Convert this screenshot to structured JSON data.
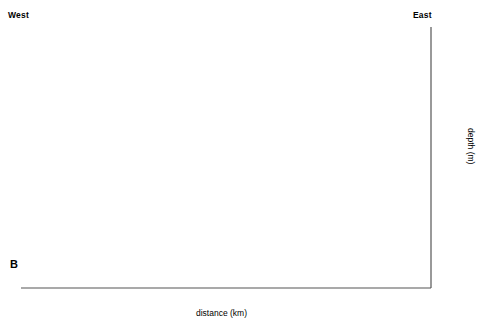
{
  "labels": {
    "west": "West",
    "east": "East",
    "panel": "B",
    "x_axis_title": "distance (km)",
    "y_axis_title": "depth (m)"
  },
  "axes": {
    "x_ticks": [
      "100",
      "110",
      "120",
      "130",
      "140",
      "150"
    ],
    "x_tick_values": [
      100,
      110,
      120,
      130,
      140,
      150
    ],
    "y_ticks": [
      "+3.0",
      "+2.0",
      "+1.0",
      "O.D.",
      "-1.0",
      "-2.0",
      "-3.0",
      "-4.0",
      "-5.0"
    ],
    "y_tick_values": [
      3,
      2,
      1,
      0,
      -1,
      -2,
      -3,
      -4,
      -5
    ]
  },
  "chart_data": {
    "type": "scatter",
    "title": "",
    "xlabel": "distance (km)",
    "ylabel": "depth (m)",
    "xlim": [
      100,
      150
    ],
    "ylim": [
      -5.0,
      3.0
    ],
    "grid": false,
    "legend": "none",
    "panel_label": "B",
    "direction_left": "West",
    "direction_right": "East",
    "y_tick_labels": [
      "+3.0",
      "+2.0",
      "+1.0",
      "O.D.",
      "-1.0",
      "-2.0",
      "-3.0",
      "-4.0",
      "-5.0"
    ],
    "x_tick_labels": [
      "100",
      "110",
      "120",
      "130",
      "140",
      "150"
    ],
    "points": [
      {
        "x": 107.0,
        "y": -3.6
      },
      {
        "x": 110.0,
        "y": -3.6
      },
      {
        "x": 110.0,
        "y": -3.28
      },
      {
        "x": 115.5,
        "y": -1.57
      },
      {
        "x": 117.0,
        "y": -1.42
      },
      {
        "x": 120.8,
        "y": -0.63
      },
      {
        "x": 125.0,
        "y": -0.99
      },
      {
        "x": 126.3,
        "y": -0.95
      },
      {
        "x": 126.3,
        "y": -1.28
      },
      {
        "x": 131.3,
        "y": 0.35
      },
      {
        "x": 131.3,
        "y": 0.05
      },
      {
        "x": 134.0,
        "y": 0.39
      },
      {
        "x": 137.7,
        "y": 0.6
      },
      {
        "x": 139.0,
        "y": 0.6
      },
      {
        "x": 140.3,
        "y": 0.74
      },
      {
        "x": 141.1,
        "y": 0.74
      },
      {
        "x": 141.9,
        "y": 0.62
      }
    ],
    "isochrone_curves": [
      {
        "label": "2850 yr BP",
        "age_yr_bp": 2850,
        "vertices": [
          [
            100,
            -1.28
          ],
          [
            118.0,
            -0.78
          ],
          [
            126.0,
            -0.48
          ],
          [
            133.0,
            0.92
          ],
          [
            150,
            3.02
          ]
        ]
      },
      {
        "label": "3625 yr BP",
        "age_yr_bp": 3625,
        "vertices": [
          [
            100,
            -1.7
          ],
          [
            118.0,
            -1.22
          ],
          [
            126.0,
            -0.95
          ],
          [
            133.0,
            0.3
          ],
          [
            150,
            2.2
          ]
        ]
      },
      {
        "label": "4350 yr BP",
        "age_yr_bp": 4350,
        "vertices": [
          [
            100,
            -2.3
          ],
          [
            118.0,
            -1.87
          ],
          [
            126.0,
            -1.65
          ],
          [
            133.0,
            -0.45
          ],
          [
            150,
            1.1
          ]
        ]
      },
      {
        "label": "5200 yr BP",
        "age_yr_bp": 5200,
        "vertices": [
          [
            100,
            -4.22
          ],
          [
            110.0,
            -3.92
          ],
          [
            121.0,
            -3.55
          ],
          [
            127.5,
            -3.12
          ],
          [
            135.0,
            -1.52
          ],
          [
            150,
            0.1
          ]
        ]
      }
    ]
  },
  "curve_labels": [
    {
      "text": "2850 yr BP"
    },
    {
      "text": "3625 yr BP"
    },
    {
      "text": "4350 yr BP"
    },
    {
      "text": "5200 yr BP"
    }
  ]
}
